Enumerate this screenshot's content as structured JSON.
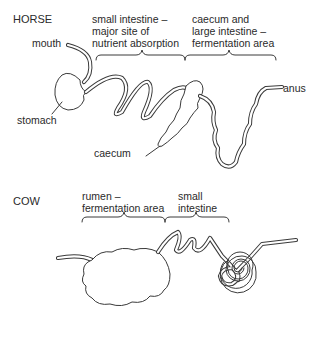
{
  "horse": {
    "title": "HORSE",
    "labels": {
      "mouth": "mouth",
      "stomach": "stomach",
      "caecum": "caecum",
      "anus": "anus",
      "small_intestine": [
        "small intestine –",
        "major site of",
        "nutrient absorption"
      ],
      "large_intestine": [
        "caecum and",
        "large intestine –",
        "fermentation area"
      ]
    }
  },
  "cow": {
    "title": "COW",
    "labels": {
      "rumen": [
        "rumen –",
        "fermentation area"
      ],
      "small_intestine": [
        "small",
        "intestine"
      ]
    }
  },
  "colors": {
    "line": "#3a3a3a",
    "text": "#2a2a2a",
    "background": "#ffffff"
  }
}
